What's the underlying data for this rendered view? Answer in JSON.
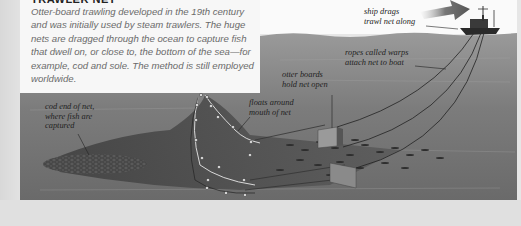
{
  "info_panel": {
    "heading": "TRAWLER NET",
    "body": "Otter-board trawling developed in the 19th century and was initially used by steam trawlers. The huge nets are dragged through the ocean to capture fish that dwell on, or close to, the bottom of the sea—for example, cod and sole. The method is still employed worldwide."
  },
  "diagram": {
    "labels": {
      "ship": "ship drags\ntrawl net along",
      "warps": "ropes called warps\nattach net to boat",
      "otter_boards": "otter boards\nhold net open",
      "floats": "floats around\nmouth of net",
      "cod_end": "cod end of net,\nwhere fish are\ncaptured"
    },
    "colors": {
      "sea_dark": "#5e5e5e",
      "sea_light": "#8c8c8c",
      "net": "#4a4a4a",
      "ship": "#2a2a2a",
      "text_box": "#f7f7f7"
    }
  }
}
